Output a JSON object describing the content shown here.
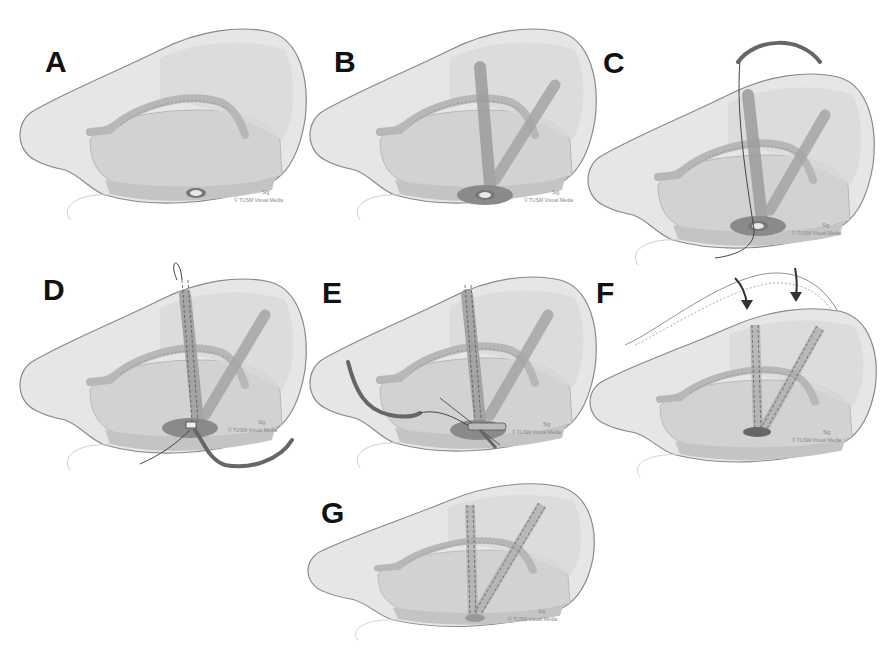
{
  "figure": {
    "panels": [
      {
        "id": "A",
        "label": "A",
        "signature": "Sig",
        "credit": "© TUSM Visual Media"
      },
      {
        "id": "B",
        "label": "B",
        "signature": "Sig",
        "credit": "© TUSM Visual Media"
      },
      {
        "id": "C",
        "label": "C",
        "signature": "Sig",
        "credit": "© TUSM Visual Media"
      },
      {
        "id": "D",
        "label": "D",
        "signature": "Sig",
        "credit": "© TUSM Visual Media"
      },
      {
        "id": "E",
        "label": "E",
        "signature": "Sig",
        "credit": "© TUSM Visual Media"
      },
      {
        "id": "F",
        "label": "F",
        "signature": "Sig",
        "credit": "© TUSM Visual Media"
      },
      {
        "id": "G",
        "label": "G",
        "signature": "Sig",
        "credit": "© TUSM Visual Media"
      }
    ]
  },
  "colors": {
    "outer": "#e4e4e4",
    "outline": "#8a8a8a",
    "inner": "#cfcfcf",
    "tube": "#a9a9a9",
    "dark": "#555555",
    "label": "#111111"
  }
}
